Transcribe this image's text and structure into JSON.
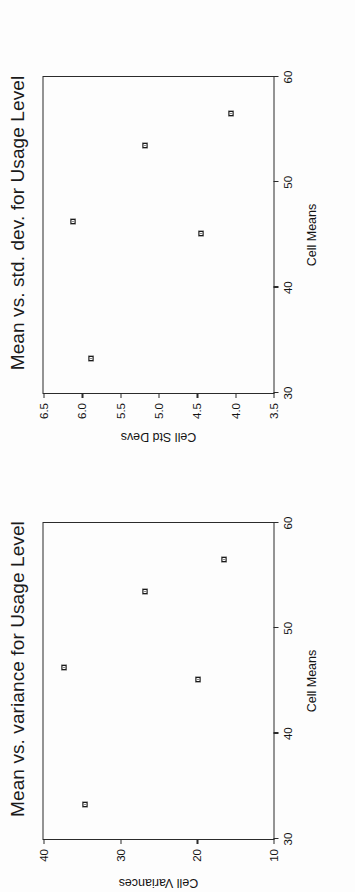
{
  "page": {
    "background_color": "#fdfdfd",
    "ink_color": "#1a1a1a",
    "orientation_note": "figures printed sideways (rotated 90 degrees)"
  },
  "charts": [
    {
      "id": "std-dev-chart",
      "title": "Mean vs. std. dev. for Usage Level",
      "xlabel": "Cell Means",
      "ylabel": "Cell Std Devs",
      "xticks": [
        "30",
        "40",
        "50",
        "60"
      ],
      "yticks": [
        "3.5",
        "4.0",
        "4.5",
        "5.0",
        "5.5",
        "6.0",
        "6.5"
      ]
    },
    {
      "id": "variance-chart",
      "title": "Mean vs. variance for Usage Level",
      "xlabel": "Cell Means",
      "ylabel": "Cell Variances",
      "xticks": [
        "30",
        "40",
        "50",
        "60"
      ],
      "yticks": [
        "10",
        "20",
        "30",
        "40"
      ]
    }
  ],
  "chart_data": [
    {
      "type": "scatter",
      "title": "Mean vs. std. dev. for Usage Level",
      "xlabel": "Cell Means",
      "ylabel": "Cell Std Devs",
      "xlim": [
        30,
        60
      ],
      "ylim": [
        3.5,
        6.5
      ],
      "xticks": [
        30,
        40,
        50,
        60
      ],
      "yticks": [
        3.5,
        4.0,
        4.5,
        5.0,
        5.5,
        6.0,
        6.5
      ],
      "grid": false,
      "legend": false,
      "marker": "open-square",
      "series": [
        {
          "name": "cells",
          "points": [
            {
              "x": 33.3,
              "y": 5.88
            },
            {
              "x": 45.1,
              "y": 4.45
            },
            {
              "x": 46.3,
              "y": 6.11
            },
            {
              "x": 53.5,
              "y": 5.18
            },
            {
              "x": 56.5,
              "y": 4.06
            }
          ]
        }
      ]
    },
    {
      "type": "scatter",
      "title": "Mean vs. variance for Usage Level",
      "xlabel": "Cell Means",
      "ylabel": "Cell Variances",
      "xlim": [
        30,
        60
      ],
      "ylim": [
        10,
        40
      ],
      "xticks": [
        30,
        40,
        50,
        60
      ],
      "yticks": [
        10,
        20,
        30,
        40
      ],
      "grid": false,
      "legend": false,
      "marker": "open-square",
      "series": [
        {
          "name": "cells",
          "points": [
            {
              "x": 33.3,
              "y": 34.6
            },
            {
              "x": 45.1,
              "y": 19.8
            },
            {
              "x": 46.3,
              "y": 37.3
            },
            {
              "x": 53.5,
              "y": 26.8
            },
            {
              "x": 56.5,
              "y": 16.5
            }
          ]
        }
      ]
    }
  ]
}
